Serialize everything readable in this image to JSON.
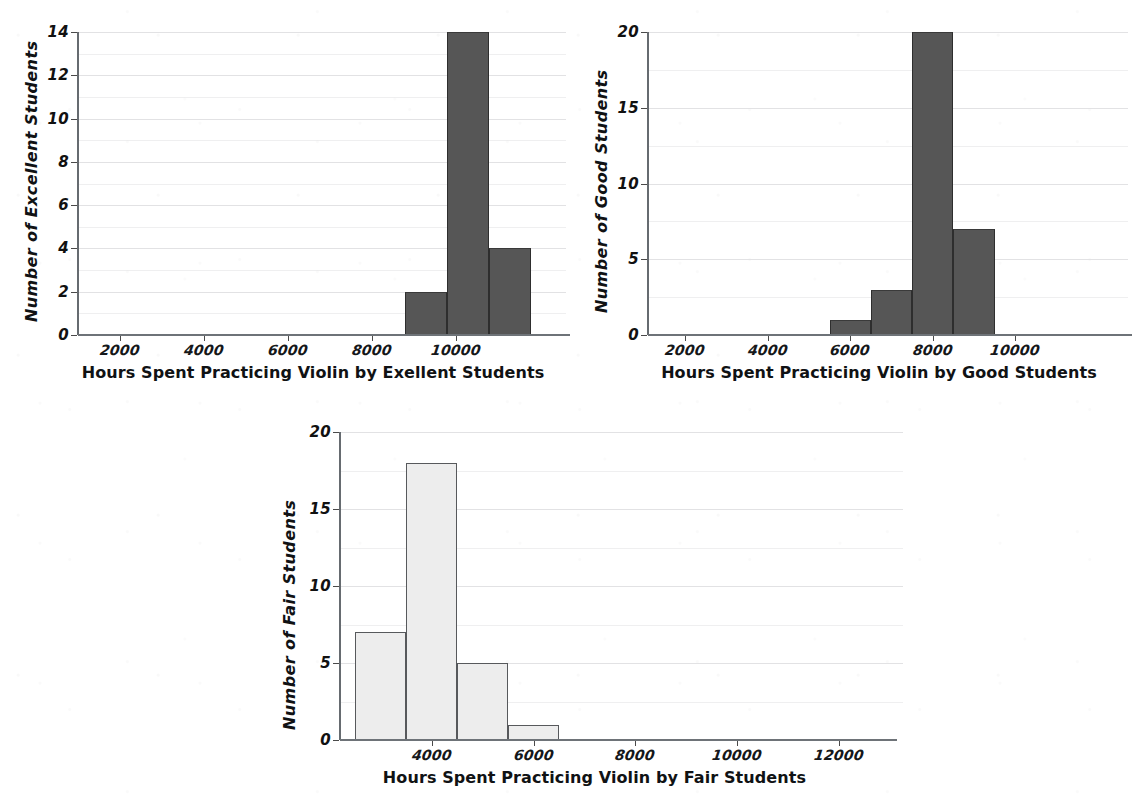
{
  "figure": {
    "background_color": "#ffffff",
    "panel_count": 3
  },
  "chart_data": [
    {
      "id": "excellent",
      "type": "bar",
      "title": "",
      "xlabel": "Hours Spent Practicing Violin by Exellent Students",
      "ylabel": "Number of Excellent Students",
      "grid": true,
      "legend": "none",
      "bar_color": "#565656",
      "bar_style": "filled-dark",
      "xlim": [
        1000,
        12200
      ],
      "ylim": [
        0,
        14
      ],
      "xticks": [
        2000,
        4000,
        6000,
        8000,
        10000
      ],
      "xtick_labels": [
        "2000",
        "4000",
        "6000",
        "8000",
        "10000"
      ],
      "yticks": [
        0,
        2,
        4,
        6,
        8,
        10,
        12,
        14
      ],
      "ytick_labels": [
        "0",
        "2",
        "4",
        "6",
        "8",
        "10",
        "12",
        "14"
      ],
      "bin_edges": [
        8800,
        9800,
        10800,
        11800
      ],
      "bin_labels": [
        "8800-9800",
        "9800-10800",
        "10800-11800"
      ],
      "values": [
        2,
        14,
        4
      ]
    },
    {
      "id": "good",
      "type": "bar",
      "title": "",
      "xlabel": "Hours Spent Practicing Violin by Good Students",
      "ylabel": "Number of Good Students",
      "grid": true,
      "legend": "none",
      "bar_color": "#565656",
      "bar_style": "filled-dark",
      "xlim": [
        1100,
        12300
      ],
      "ylim": [
        0,
        20
      ],
      "xticks": [
        2000,
        4000,
        6000,
        8000,
        10000
      ],
      "xtick_labels": [
        "2000",
        "4000",
        "6000",
        "8000",
        "10000"
      ],
      "yticks": [
        0,
        5,
        10,
        15,
        20
      ],
      "ytick_labels": [
        "0",
        "5",
        "10",
        "15",
        "20"
      ],
      "bin_edges": [
        5500,
        6500,
        7500,
        8500,
        9500
      ],
      "bin_labels": [
        "5500-6500",
        "6500-7500",
        "7500-8500",
        "8500-9500"
      ],
      "values": [
        1,
        3,
        20,
        7
      ]
    },
    {
      "id": "fair",
      "type": "bar",
      "title": "",
      "xlabel": "Hours Spent Practicing Violin by Fair Students",
      "ylabel": "Number of  Fair Students",
      "grid": true,
      "legend": "none",
      "bar_color": "#ededed",
      "bar_edge_color": "#57595c",
      "bar_style": "outlined-light",
      "xlim": [
        2200,
        12900
      ],
      "ylim": [
        0,
        20
      ],
      "xticks": [
        4000,
        6000,
        8000,
        10000,
        12000
      ],
      "xtick_labels": [
        "4000",
        "6000",
        "8000",
        "10000",
        "12000"
      ],
      "yticks": [
        0,
        5,
        10,
        15,
        20
      ],
      "ytick_labels": [
        "0",
        "5",
        "10",
        "15",
        "20"
      ],
      "bin_edges": [
        2500,
        3500,
        4500,
        5500,
        6500
      ],
      "bin_labels": [
        "2500-3500",
        "3500-4500",
        "4500-5500",
        "5500-6500"
      ],
      "values": [
        7,
        18,
        5,
        1
      ]
    }
  ]
}
